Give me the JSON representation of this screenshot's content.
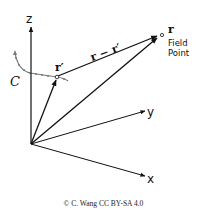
{
  "diagram": {
    "axes": {
      "z_label": "z",
      "y_label": "y",
      "x_label": "x"
    },
    "vectors": {
      "source_label": "r′",
      "field_label": "r",
      "difference_label": "r − r′"
    },
    "curve_label": "C",
    "field_point_label_line1": "Field",
    "field_point_label_line2": "Point",
    "colors": {
      "ink": "#111111",
      "curve": "#777777",
      "background": "#ffffff"
    }
  },
  "credit": "© C. Wang CC BY-SA 4.0"
}
